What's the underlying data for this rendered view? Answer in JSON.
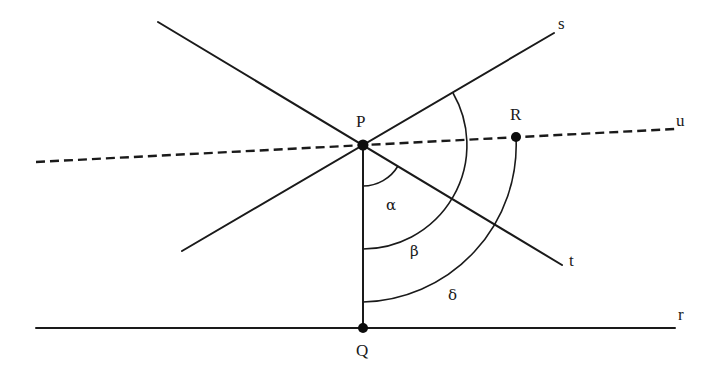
{
  "diagram": {
    "type": "geometry-construction",
    "colors": {
      "ink": "#1a1a1a",
      "background": "#ffffff"
    },
    "points": [
      {
        "id": "P",
        "label": "P",
        "x": 363,
        "y": 145
      },
      {
        "id": "Q",
        "label": "Q",
        "x": 363,
        "y": 328
      },
      {
        "id": "R",
        "label": "R",
        "x": 516,
        "y": 137
      }
    ],
    "lines": [
      {
        "id": "s",
        "label": "s",
        "style": "solid",
        "x1": 182,
        "y1": 251,
        "x2": 554,
        "y2": 33
      },
      {
        "id": "t",
        "label": "t",
        "style": "solid",
        "x1": 158,
        "y1": 22,
        "x2": 562,
        "y2": 265
      },
      {
        "id": "u",
        "label": "u",
        "style": "dashed",
        "x1": 36,
        "y1": 162,
        "x2": 675,
        "y2": 129
      },
      {
        "id": "r",
        "label": "r",
        "style": "solid",
        "x1": 36,
        "y1": 328,
        "x2": 675,
        "y2": 328
      },
      {
        "id": "PQ",
        "label": "",
        "style": "solid",
        "x1": 363,
        "y1": 145,
        "x2": 363,
        "y2": 328
      }
    ],
    "angles": [
      {
        "id": "alpha",
        "label": "α",
        "between": [
          "PQ",
          "t"
        ]
      },
      {
        "id": "beta",
        "label": "β",
        "between": [
          "PQ",
          "s"
        ]
      },
      {
        "id": "delta",
        "label": "δ",
        "between": [
          "PQ",
          "PR"
        ]
      }
    ],
    "labels": {
      "P": "P",
      "Q": "Q",
      "R": "R",
      "s": "s",
      "t": "t",
      "u": "u",
      "r": "r",
      "alpha": "α",
      "beta": "β",
      "delta": "δ"
    }
  }
}
